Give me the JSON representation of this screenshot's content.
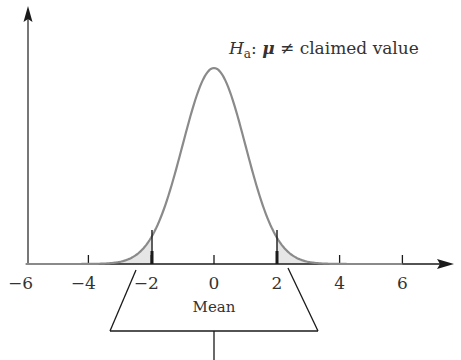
{
  "chart_data": {
    "type": "line",
    "title": "",
    "xlabel": "",
    "ylabel": "",
    "xlim": [
      -6,
      6.8
    ],
    "ylim": [
      0,
      0.42
    ],
    "grid": false,
    "legend": null,
    "x_ticks": [
      -6,
      -4,
      -2,
      0,
      2,
      4,
      6
    ],
    "x_tick_labels": [
      "−6",
      "−4",
      "−2",
      "0",
      "2",
      "4",
      "6"
    ],
    "series": [
      {
        "name": "Standard normal density",
        "distribution": "normal",
        "mean": 0,
        "sd": 1,
        "x": [
          -6,
          -4,
          -3,
          -2.5,
          -2,
          -1.5,
          -1,
          -0.5,
          0,
          0.5,
          1,
          1.5,
          2,
          2.5,
          3,
          4,
          6
        ],
        "values": [
          0.0,
          0.0001,
          0.0044,
          0.0175,
          0.054,
          0.1295,
          0.242,
          0.3521,
          0.3989,
          0.3521,
          0.242,
          0.1295,
          0.054,
          0.0175,
          0.0044,
          0.0001,
          0.0
        ]
      }
    ],
    "shaded_regions": [
      {
        "name": "left-tail",
        "from": -6,
        "to": -2
      },
      {
        "name": "right-tail",
        "from": 2,
        "to": 6
      }
    ],
    "critical_values": [
      -2,
      2
    ],
    "annotations": [
      {
        "text_parts": [
          "H",
          "a",
          ": ",
          "μ",
          " ≠ claimed value"
        ],
        "position": "above peak, right"
      },
      {
        "text": "Mean",
        "position": "callout box below axis pointing to 0"
      }
    ]
  },
  "labels": {
    "hypothesis_H": "H",
    "hypothesis_sub": "a",
    "hypothesis_colon": ": ",
    "hypothesis_mu": "μ",
    "hypothesis_rest": " ≠ claimed value",
    "mean": "Mean"
  },
  "colors": {
    "axis": "#1a1a1a",
    "curve": "#8a8a8a",
    "tail_fill": "#e6e6e6",
    "text": "#333333"
  }
}
